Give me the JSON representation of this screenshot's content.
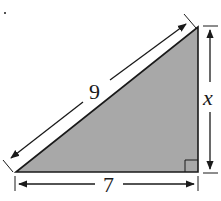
{
  "diagram": {
    "type": "right-triangle",
    "hypotenuse_label": "9",
    "base_label": "7",
    "height_label": "x",
    "fill_color": "#a8a8a8",
    "stroke_color": "#1a1a1a",
    "right_angle_marker": true
  }
}
